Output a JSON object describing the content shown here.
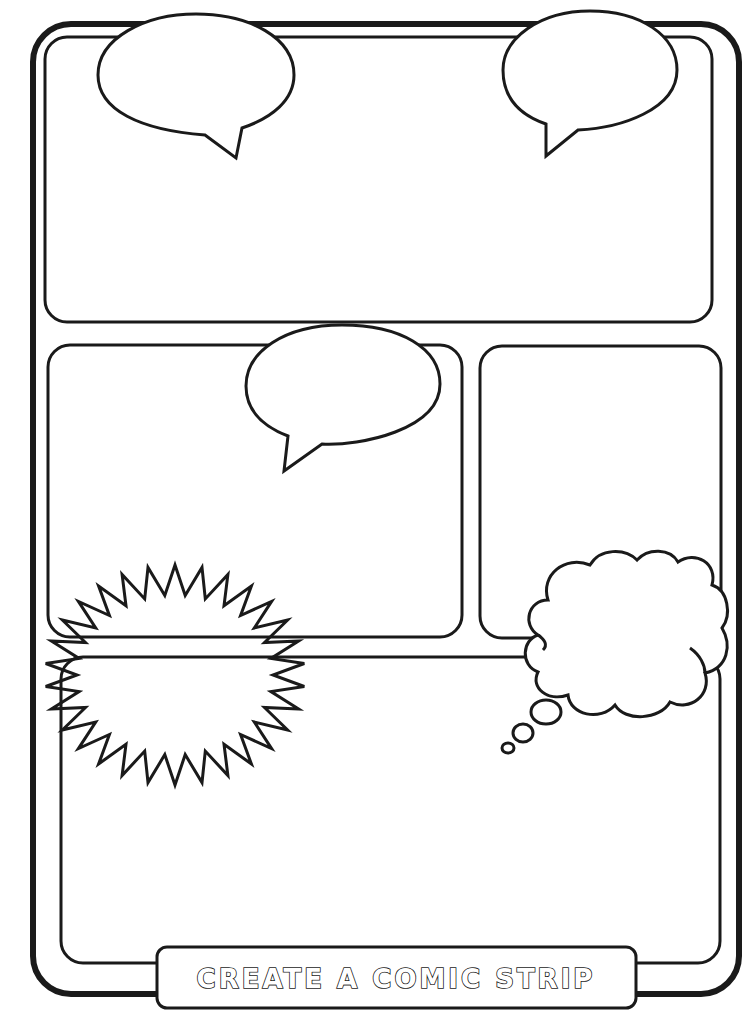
{
  "worksheet": {
    "title": "CREATE A COMIC STRIP",
    "colors": {
      "ink": "#1a1a1a",
      "paper": "#ffffff"
    },
    "panels": [
      {
        "id": "panel-1",
        "label": "top-wide-panel",
        "x": 45,
        "y": 37,
        "w": 667,
        "h": 285
      },
      {
        "id": "panel-2",
        "label": "middle-left-panel",
        "x": 48,
        "y": 345,
        "w": 414,
        "h": 292
      },
      {
        "id": "panel-3",
        "label": "middle-right-panel",
        "x": 480,
        "y": 346,
        "w": 241,
        "h": 292
      },
      {
        "id": "panel-4",
        "label": "bottom-wide-panel",
        "x": 61,
        "y": 657,
        "w": 659,
        "h": 306
      }
    ],
    "balloons": [
      {
        "type": "speech-bubble",
        "panel": "panel-1",
        "position": "top-left"
      },
      {
        "type": "speech-bubble",
        "panel": "panel-1",
        "position": "top-right"
      },
      {
        "type": "speech-bubble",
        "panel": "panel-2",
        "position": "top-right"
      },
      {
        "type": "thought-cloud",
        "panel": "panel-3",
        "position": "bottom-right"
      },
      {
        "type": "starburst",
        "panel": "panel-2",
        "position": "bottom-left"
      }
    ]
  }
}
